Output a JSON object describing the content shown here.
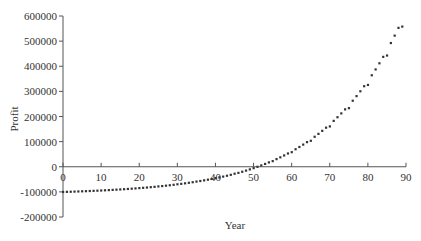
{
  "chart_data": {
    "type": "scatter",
    "title": "",
    "xlabel": "Year",
    "ylabel": "Profit",
    "xlim": [
      0,
      90
    ],
    "ylim": [
      -200000,
      600000
    ],
    "xticks": [
      "0",
      "10",
      "20",
      "30",
      "40",
      "50",
      "60",
      "70",
      "80",
      "90"
    ],
    "yticks": [
      "600000",
      "500000",
      "400000",
      "300000",
      "200000",
      "100000",
      "0",
      "-100000",
      "-200000"
    ],
    "grid": false,
    "legend": null,
    "series": [
      {
        "name": "Profit",
        "color": "#333333",
        "x": [
          0,
          1,
          2,
          3,
          4,
          5,
          6,
          7,
          8,
          9,
          10,
          11,
          12,
          13,
          14,
          15,
          16,
          17,
          18,
          19,
          20,
          21,
          22,
          23,
          24,
          25,
          26,
          27,
          28,
          29,
          30,
          31,
          32,
          33,
          34,
          35,
          36,
          37,
          38,
          39,
          40,
          41,
          42,
          43,
          44,
          45,
          46,
          47,
          48,
          49,
          50,
          51,
          52,
          53,
          54,
          55,
          56,
          57,
          58,
          59,
          60,
          61,
          62,
          63,
          64,
          65,
          66,
          67,
          68,
          69,
          70,
          71,
          72,
          73,
          74,
          75,
          76,
          77,
          78,
          79,
          80,
          81,
          82,
          83,
          84,
          85,
          86,
          87,
          88,
          89
        ],
        "values": [
          -100000,
          -99529,
          -99035,
          -98518,
          -97976,
          -97402,
          -96810,
          -96183,
          -95526,
          -94837,
          -94107,
          -93351,
          -92558,
          -91727,
          -90855,
          -89934,
          -88985,
          -87989,
          -86945,
          -85850,
          -84631,
          -83498,
          -82236,
          -80913,
          -79525,
          -77908,
          -76542,
          -74937,
          -73254,
          -71490,
          -69368,
          -67685,
          -65630,
          -63475,
          -61215,
          -58539,
          -56376,
          -53785,
          -51068,
          -48219,
          -44803,
          -42114,
          -38826,
          -35378,
          -31763,
          -27367,
          -23999,
          -19598,
          -14984,
          -10145,
          -5233,
          215,
          5767,
          11588,
          17692,
          22779,
          30808,
          37916,
          45370,
          53185,
          58424,
          70032,
          79060,
          88526,
          98451,
          103633,
          119766,
          131242,
          143276,
          155895,
          160917,
          182955,
          197510,
          212771,
          228773,
          233656,
          263117,
          281503,
          300782,
          320997,
          326006,
          364445,
          387735,
          412157,
          437766,
          443085,
          492804,
          522264,
          553154,
          558232
        ]
      }
    ]
  },
  "axes": {
    "x_label": "Year",
    "y_label": "Profit"
  }
}
